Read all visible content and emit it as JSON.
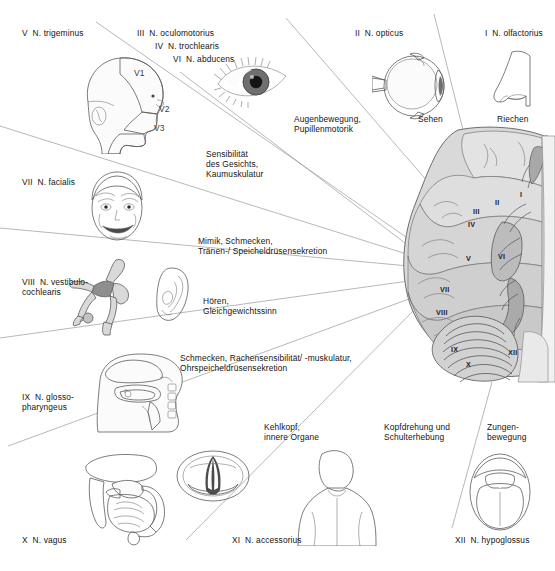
{
  "figure": {
    "language": "de",
    "background": "#ffffff",
    "line_color": "#8a8a8a"
  },
  "nerves": [
    {
      "id": "I",
      "label": "I  N. olfactorius",
      "function": "Riechen",
      "roman": "I"
    },
    {
      "id": "II",
      "label": "II  N. opticus",
      "function": "Sehen",
      "roman": "II"
    },
    {
      "id": "III",
      "label": "III  N. oculomotorius",
      "function": "Augenbewegung,\nPupillenmotorik",
      "roman": "III"
    },
    {
      "id": "IV",
      "label": "IV  N. trochlearis",
      "function": "",
      "roman": "IV"
    },
    {
      "id": "VI",
      "label": "VI  N. abducens",
      "function": "",
      "roman": "VI"
    },
    {
      "id": "V",
      "label": "V  N. trigeminus",
      "function": "Sensibilität\ndes Gesichts,\nKaumuskulatur",
      "roman": "V"
    },
    {
      "id": "VII",
      "label": "VII  N. facialis",
      "function": "Mimik, Schmecken,\nTränen-/ Speicheldrüsensekretion",
      "roman": "VII"
    },
    {
      "id": "VIII",
      "label": "VIII  N. vestibulo-\ncochlearis",
      "function": "Hören,\nGleichgewichtssinn",
      "roman": "VIII"
    },
    {
      "id": "IX",
      "label": "IX  N. glosso-\npharyngeus",
      "function": "Schmecken, Rachensensibilität/ -muskulatur,\nOhrspeicheldrüsensekretion",
      "roman": "IX"
    },
    {
      "id": "X",
      "label": "X  N. vagus",
      "function": "Kehlkopf,\ninnere Organe",
      "roman": "X"
    },
    {
      "id": "XI",
      "label": "XI  N. accessorius",
      "function": "Kopfdrehung und\nSchulterhebung",
      "roman": "XI"
    },
    {
      "id": "XII",
      "label": "XII  N. hypoglossus",
      "function": "Zungen-\nbewegung",
      "roman": "XII"
    }
  ],
  "labels": {
    "trigeminus": "V  N. trigeminus",
    "oculomotorius": "III  N. oculomotorius",
    "trochlearis": "IV  N. trochlearis",
    "abducens": "VI  N. abducens",
    "opticus": "II  N. opticus",
    "olfactorius": "I  N. olfactorius",
    "facialis": "VII  N. facialis",
    "vestibulocochlearis_1": "VIII  N. vestibulo-",
    "vestibulocochlearis_2": "cochlearis",
    "glossopharyngeus_1": "IX  N. glosso-",
    "glossopharyngeus_2": "pharyngeus",
    "vagus": "X  N. vagus",
    "accessorius": "XI  N. accessorius",
    "hypoglossus": "XII  N. hypoglossus"
  },
  "functions": {
    "augenbewegung_1": "Augenbewegung,",
    "augenbewegung_2": "Pupillenmotorik",
    "sehen": "Sehen",
    "riechen": "Riechen",
    "sensibilitaet_1": "Sensibilität",
    "sensibilitaet_2": "des Gesichts,",
    "sensibilitaet_3": "Kaumuskulatur",
    "mimik_1": "Mimik, Schmecken,",
    "mimik_2": "Tränen-/ Speicheldrüsensekretion",
    "hoeren_1": "Hören,",
    "hoeren_2": "Gleichgewichtssinn",
    "schmecken_1": "Schmecken, Rachensensibilität/ -muskulatur,",
    "schmecken_2": "Ohrspeicheldrüsensekretion",
    "kehlkopf_1": "Kehlkopf,",
    "kehlkopf_2": "innere Organe",
    "kopfdrehung_1": "Kopfdrehung und",
    "kopfdrehung_2": "Schulterhebung",
    "zungen_1": "Zungen-",
    "zungen_2": "bewegung"
  },
  "head_diagram": {
    "v1": "V1",
    "v2": "V2",
    "v3": "V3"
  },
  "brain_roman_labels": [
    "I",
    "II",
    "III",
    "IV",
    "V",
    "VI",
    "VII",
    "VIII",
    "IX",
    "X",
    "XII"
  ]
}
